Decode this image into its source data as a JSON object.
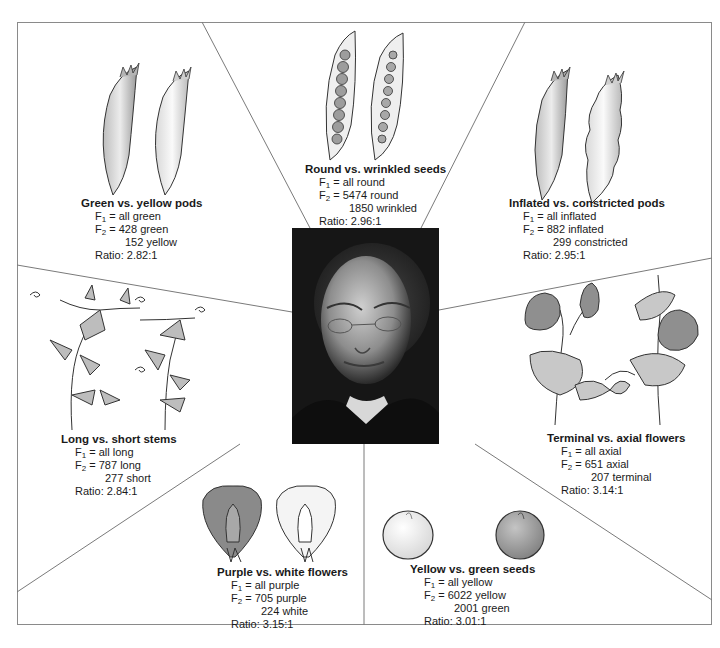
{
  "figure": {
    "center_photo": {
      "description": "Portrait of Gregor Mendel"
    },
    "traits": [
      {
        "id": "pods-color",
        "title": "Green vs. yellow pods",
        "f1": "= all green",
        "f2_line1": "= 428 green",
        "f2_line2": "152 yellow",
        "ratio": "Ratio: 2.82:1"
      },
      {
        "id": "seed-shape",
        "title": "Round vs. wrinkled seeds",
        "f1": "= all round",
        "f2_line1": "= 5474 round",
        "f2_line2": "1850 wrinkled",
        "ratio": "Ratio: 2.96:1"
      },
      {
        "id": "pod-shape",
        "title": "Inflated vs. constricted pods",
        "f1": "= all inflated",
        "f2_line1": "= 882 inflated",
        "f2_line2": "299 constricted",
        "ratio": "Ratio: 2.95:1"
      },
      {
        "id": "stem-length",
        "title": "Long vs. short stems",
        "f1": "= all long",
        "f2_line1": "= 787 long",
        "f2_line2": "277 short",
        "ratio": "Ratio: 2.84:1"
      },
      {
        "id": "flower-position",
        "title": "Terminal vs. axial flowers",
        "f1": "= all axial",
        "f2_line1": "= 651 axial",
        "f2_line2": "207 terminal",
        "ratio": "Ratio: 3.14:1"
      },
      {
        "id": "flower-color",
        "title": "Purple vs. white flowers",
        "f1": "= all purple",
        "f2_line1": "= 705 purple",
        "f2_line2": "224 white",
        "ratio": "Ratio: 3.15:1"
      },
      {
        "id": "seed-color",
        "title": "Yellow vs. green seeds",
        "f1": "= all yellow",
        "f2_line1": "= 6022 yellow",
        "f2_line2": "2001 green",
        "ratio": "Ratio: 3.01:1"
      }
    ],
    "gen_labels": {
      "f": "F",
      "one": "1",
      "two": "2"
    }
  }
}
